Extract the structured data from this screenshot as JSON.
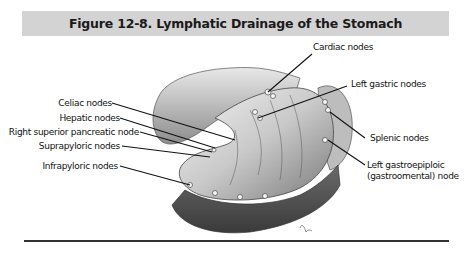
{
  "figure": {
    "title": "Figure 12-8. Lymphatic Drainage of the Stomach",
    "title_bar_color": "#d3d3d3",
    "rule_color": "#333333"
  },
  "labels": {
    "left": [
      {
        "text": "Celiac nodes"
      },
      {
        "text": "Hepatic nodes"
      },
      {
        "text": "Right superior pancreatic node"
      },
      {
        "text": "Suprapyloric nodes"
      },
      {
        "text": "Infrapyloric nodes"
      }
    ],
    "right": [
      {
        "text": "Cardiac nodes"
      },
      {
        "text": "Left gastric nodes"
      },
      {
        "text": "Splenic nodes"
      },
      {
        "text": "Left gastroepiploic"
      },
      {
        "text": "(gastroomental) node"
      }
    ]
  },
  "illustration": {
    "subject": "stomach anatomical drawing with lymph nodes",
    "signature": "artist signature"
  }
}
